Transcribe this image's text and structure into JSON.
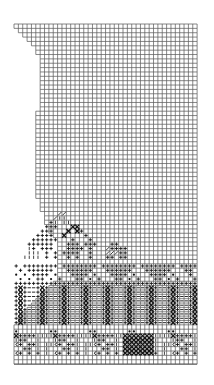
{
  "diagram": {
    "type": "knitting-chart",
    "colors": {
      "background": "#ffffff",
      "grid": "#555555",
      "symbol": "#111111"
    },
    "grid": {
      "origin_x": 14,
      "origin_y": 24,
      "cell": 4.36,
      "cols": 42,
      "rows": 78
    },
    "left_edge_offsets": [
      0,
      1,
      2,
      3,
      4,
      5,
      5,
      6,
      6,
      6,
      6,
      6,
      6,
      6,
      6,
      6,
      6,
      6,
      6,
      6,
      5,
      5,
      5,
      5,
      5,
      5,
      5,
      5,
      5,
      5,
      5,
      5,
      5,
      5,
      5,
      5,
      5,
      5,
      5,
      5,
      6,
      6,
      6,
      7,
      7,
      7,
      8,
      8,
      9,
      10,
      10,
      10,
      10,
      10,
      10,
      10,
      10,
      10,
      10,
      9,
      8,
      7,
      6,
      5,
      4,
      3,
      2,
      1,
      1,
      0,
      0,
      0,
      0,
      0,
      0,
      0,
      0,
      0
    ],
    "symbol_rows": [
      {
        "row": 43,
        "cells": [
          [
            10,
            "/"
          ],
          [
            11,
            "/"
          ]
        ]
      },
      {
        "row": 44,
        "cells": [
          [
            9,
            "/"
          ],
          [
            10,
            "l"
          ],
          [
            11,
            "l"
          ]
        ]
      },
      {
        "row": 45,
        "cells": [
          [
            8,
            "+"
          ],
          [
            9,
            "l"
          ],
          [
            11,
            "l"
          ],
          [
            12,
            "l"
          ]
        ]
      },
      {
        "row": 46,
        "cells": [
          [
            7,
            "+"
          ],
          [
            8,
            "+"
          ],
          [
            9,
            "+"
          ],
          [
            13,
            "x"
          ],
          [
            14,
            "x"
          ]
        ]
      },
      {
        "row": 47,
        "cells": [
          [
            6,
            "+"
          ],
          [
            7,
            "+"
          ],
          [
            8,
            "+"
          ],
          [
            12,
            "x"
          ],
          [
            14,
            "x"
          ],
          [
            15,
            "+"
          ]
        ]
      },
      {
        "row": 48,
        "cells": [
          [
            5,
            "+"
          ],
          [
            6,
            "+"
          ],
          [
            7,
            "+"
          ],
          [
            8,
            "+"
          ],
          [
            11,
            "x"
          ],
          [
            16,
            "+"
          ]
        ]
      },
      {
        "row": 49,
        "cells": [
          [
            4,
            "+"
          ],
          [
            5,
            "+"
          ],
          [
            6,
            "+"
          ],
          [
            7,
            "+"
          ],
          [
            8,
            "+"
          ],
          [
            9,
            "+"
          ],
          [
            13,
            "+"
          ],
          [
            17,
            "+"
          ]
        ]
      },
      {
        "row": 50,
        "cells": [
          [
            3,
            "+"
          ],
          [
            4,
            "+"
          ],
          [
            5,
            "+"
          ],
          [
            6,
            "+"
          ],
          [
            7,
            "+"
          ],
          [
            8,
            "+"
          ],
          [
            12,
            "+"
          ],
          [
            13,
            "+"
          ],
          [
            14,
            "+"
          ],
          [
            16,
            "+"
          ],
          [
            17,
            "+"
          ],
          [
            18,
            "+"
          ],
          [
            22,
            "+"
          ],
          [
            23,
            "+"
          ]
        ]
      },
      {
        "row": 51,
        "cells": [
          [
            3,
            "l"
          ],
          [
            4,
            "+"
          ],
          [
            6,
            "+"
          ],
          [
            7,
            "+"
          ],
          [
            8,
            "+"
          ],
          [
            12,
            "+"
          ],
          [
            13,
            "+"
          ],
          [
            14,
            "+"
          ],
          [
            15,
            "+"
          ],
          [
            17,
            "+"
          ],
          [
            21,
            "/"
          ],
          [
            22,
            "+"
          ],
          [
            23,
            "+"
          ],
          [
            24,
            "+"
          ],
          [
            25,
            "+"
          ]
        ]
      },
      {
        "row": 52,
        "cells": [
          [
            3,
            "l"
          ],
          [
            4,
            "l"
          ],
          [
            5,
            "l"
          ],
          [
            7,
            "+"
          ],
          [
            9,
            "+"
          ],
          [
            11,
            "+"
          ],
          [
            12,
            "+"
          ],
          [
            13,
            "+"
          ],
          [
            14,
            "+"
          ],
          [
            17,
            "+"
          ],
          [
            21,
            "/"
          ],
          [
            22,
            "/"
          ],
          [
            23,
            "/"
          ],
          [
            24,
            "+"
          ],
          [
            25,
            "+"
          ]
        ]
      },
      {
        "row": 53,
        "cells": [
          [
            2,
            "l"
          ],
          [
            3,
            "l"
          ],
          [
            4,
            "l"
          ],
          [
            5,
            "l"
          ],
          [
            7,
            "+"
          ],
          [
            9,
            "+"
          ],
          [
            12,
            "+"
          ],
          [
            14,
            "+"
          ],
          [
            17,
            "+"
          ],
          [
            21,
            "+"
          ],
          [
            22,
            "+"
          ],
          [
            24,
            "+"
          ],
          [
            25,
            "+"
          ]
        ]
      },
      {
        "row": 55,
        "cells": [
          [
            0,
            "+"
          ],
          [
            2,
            "+"
          ],
          [
            3,
            "+"
          ],
          [
            4,
            "+"
          ],
          [
            5,
            "+"
          ],
          [
            6,
            "+"
          ],
          [
            7,
            "+"
          ],
          [
            8,
            "+"
          ],
          [
            9,
            "+"
          ],
          [
            11,
            "+"
          ],
          [
            12,
            "+"
          ],
          [
            13,
            "+"
          ],
          [
            14,
            "+"
          ],
          [
            15,
            "+"
          ],
          [
            16,
            "+"
          ],
          [
            17,
            "+"
          ],
          [
            18,
            "+"
          ],
          [
            20,
            "+"
          ],
          [
            21,
            "+"
          ],
          [
            22,
            "+"
          ],
          [
            23,
            "+"
          ],
          [
            24,
            "+"
          ],
          [
            25,
            "+"
          ],
          [
            26,
            "+"
          ],
          [
            27,
            "+"
          ],
          [
            29,
            "+"
          ],
          [
            30,
            "+"
          ],
          [
            31,
            "+"
          ],
          [
            32,
            "+"
          ],
          [
            33,
            "+"
          ],
          [
            34,
            "+"
          ],
          [
            35,
            "+"
          ],
          [
            36,
            "+"
          ],
          [
            38,
            "+"
          ],
          [
            39,
            "+"
          ],
          [
            40,
            "+"
          ],
          [
            41,
            "+"
          ]
        ]
      },
      {
        "row": 56,
        "cells": [
          [
            1,
            "+"
          ],
          [
            3,
            "+"
          ],
          [
            4,
            "+"
          ],
          [
            5,
            "+"
          ],
          [
            6,
            "+"
          ],
          [
            7,
            "+"
          ],
          [
            8,
            "+"
          ],
          [
            12,
            "+"
          ],
          [
            13,
            "+"
          ],
          [
            14,
            "+"
          ],
          [
            15,
            "+"
          ],
          [
            16,
            "+"
          ],
          [
            17,
            "+"
          ],
          [
            21,
            "+"
          ],
          [
            22,
            "+"
          ],
          [
            23,
            "+"
          ],
          [
            24,
            "+"
          ],
          [
            25,
            "+"
          ],
          [
            26,
            "+"
          ],
          [
            30,
            "+"
          ],
          [
            31,
            "+"
          ],
          [
            32,
            "+"
          ],
          [
            33,
            "+"
          ],
          [
            34,
            "+"
          ],
          [
            35,
            "+"
          ],
          [
            39,
            "+"
          ],
          [
            40,
            "+"
          ]
        ]
      },
      {
        "row": 57,
        "cells": [
          [
            0,
            "*"
          ],
          [
            2,
            "*"
          ],
          [
            4,
            "+"
          ],
          [
            5,
            "+"
          ],
          [
            6,
            "+"
          ],
          [
            7,
            "+"
          ],
          [
            9,
            "*"
          ],
          [
            13,
            "+"
          ],
          [
            14,
            "+"
          ],
          [
            15,
            "+"
          ],
          [
            16,
            "+"
          ],
          [
            18,
            "*"
          ],
          [
            22,
            "+"
          ],
          [
            23,
            "+"
          ],
          [
            24,
            "+"
          ],
          [
            25,
            "+"
          ],
          [
            27,
            "*"
          ],
          [
            31,
            "+"
          ],
          [
            32,
            "+"
          ],
          [
            33,
            "+"
          ],
          [
            34,
            "+"
          ],
          [
            36,
            "*"
          ],
          [
            40,
            "+"
          ]
        ]
      },
      {
        "row": 58,
        "cells": [
          [
            1,
            "*"
          ],
          [
            3,
            "*"
          ],
          [
            5,
            "+"
          ],
          [
            6,
            "+"
          ],
          [
            8,
            "*"
          ],
          [
            10,
            "+"
          ],
          [
            14,
            "+"
          ],
          [
            15,
            "+"
          ],
          [
            17,
            "*"
          ],
          [
            19,
            "+"
          ],
          [
            23,
            "+"
          ],
          [
            24,
            "+"
          ],
          [
            26,
            "*"
          ],
          [
            28,
            "+"
          ],
          [
            32,
            "+"
          ],
          [
            33,
            "+"
          ],
          [
            35,
            "*"
          ],
          [
            37,
            "+"
          ],
          [
            41,
            "+"
          ]
        ]
      },
      {
        "row": 59,
        "cells": [
          [
            0,
            "+"
          ],
          [
            1,
            "+"
          ],
          [
            2,
            "+"
          ],
          [
            3,
            "+"
          ],
          [
            4,
            "+"
          ],
          [
            5,
            "+"
          ],
          [
            6,
            "+"
          ],
          [
            7,
            "+"
          ],
          [
            8,
            "+"
          ],
          [
            9,
            "+"
          ],
          [
            10,
            "+"
          ],
          [
            11,
            "+"
          ],
          [
            12,
            "+"
          ],
          [
            13,
            "+"
          ],
          [
            14,
            "+"
          ],
          [
            15,
            "+"
          ],
          [
            16,
            "+"
          ],
          [
            17,
            "+"
          ],
          [
            18,
            "+"
          ],
          [
            19,
            "+"
          ],
          [
            20,
            "+"
          ],
          [
            21,
            "+"
          ],
          [
            22,
            "+"
          ],
          [
            23,
            "+"
          ],
          [
            24,
            "+"
          ],
          [
            25,
            "+"
          ],
          [
            26,
            "+"
          ],
          [
            27,
            "+"
          ],
          [
            28,
            "+"
          ],
          [
            29,
            "+"
          ],
          [
            30,
            "+"
          ],
          [
            31,
            "+"
          ],
          [
            32,
            "+"
          ],
          [
            33,
            "+"
          ],
          [
            34,
            "+"
          ],
          [
            35,
            "+"
          ],
          [
            36,
            "+"
          ],
          [
            37,
            "+"
          ],
          [
            38,
            "+"
          ],
          [
            39,
            "+"
          ],
          [
            40,
            "+"
          ],
          [
            41,
            "+"
          ]
        ]
      }
    ],
    "cable_band": {
      "start_row": 60,
      "end_row": 68,
      "repeat": 5,
      "pattern": [
        [
          "+",
          "x",
          "+",
          "-",
          "-"
        ]
      ],
      "offset_col": 0
    },
    "bottom_band": {
      "start_row": 70,
      "end_row": 76,
      "repeat": 9,
      "rows": [
        [
          "*",
          "",
          "",
          "",
          "",
          "",
          "",
          "",
          "*"
        ],
        [
          "x",
          "+",
          "+",
          "+",
          "+",
          "l",
          "l",
          "l",
          "l"
        ],
        [
          "l",
          "+",
          "+",
          "",
          "",
          "l",
          "",
          "",
          ""
        ],
        [
          "c",
          "+",
          "",
          "+",
          "+",
          "l",
          "",
          "l",
          "l"
        ],
        [
          "",
          "",
          "+",
          "+",
          "",
          "l",
          "",
          "l",
          ""
        ],
        [
          "c",
          "+",
          "",
          "+",
          "",
          "+",
          "",
          "l",
          ""
        ],
        [
          "",
          "",
          "",
          "",
          "",
          "",
          "",
          "",
          ""
        ]
      ],
      "cable_block": {
        "col_start": 25,
        "col_end": 31,
        "row_start": 71,
        "row_end": 75
      }
    }
  }
}
